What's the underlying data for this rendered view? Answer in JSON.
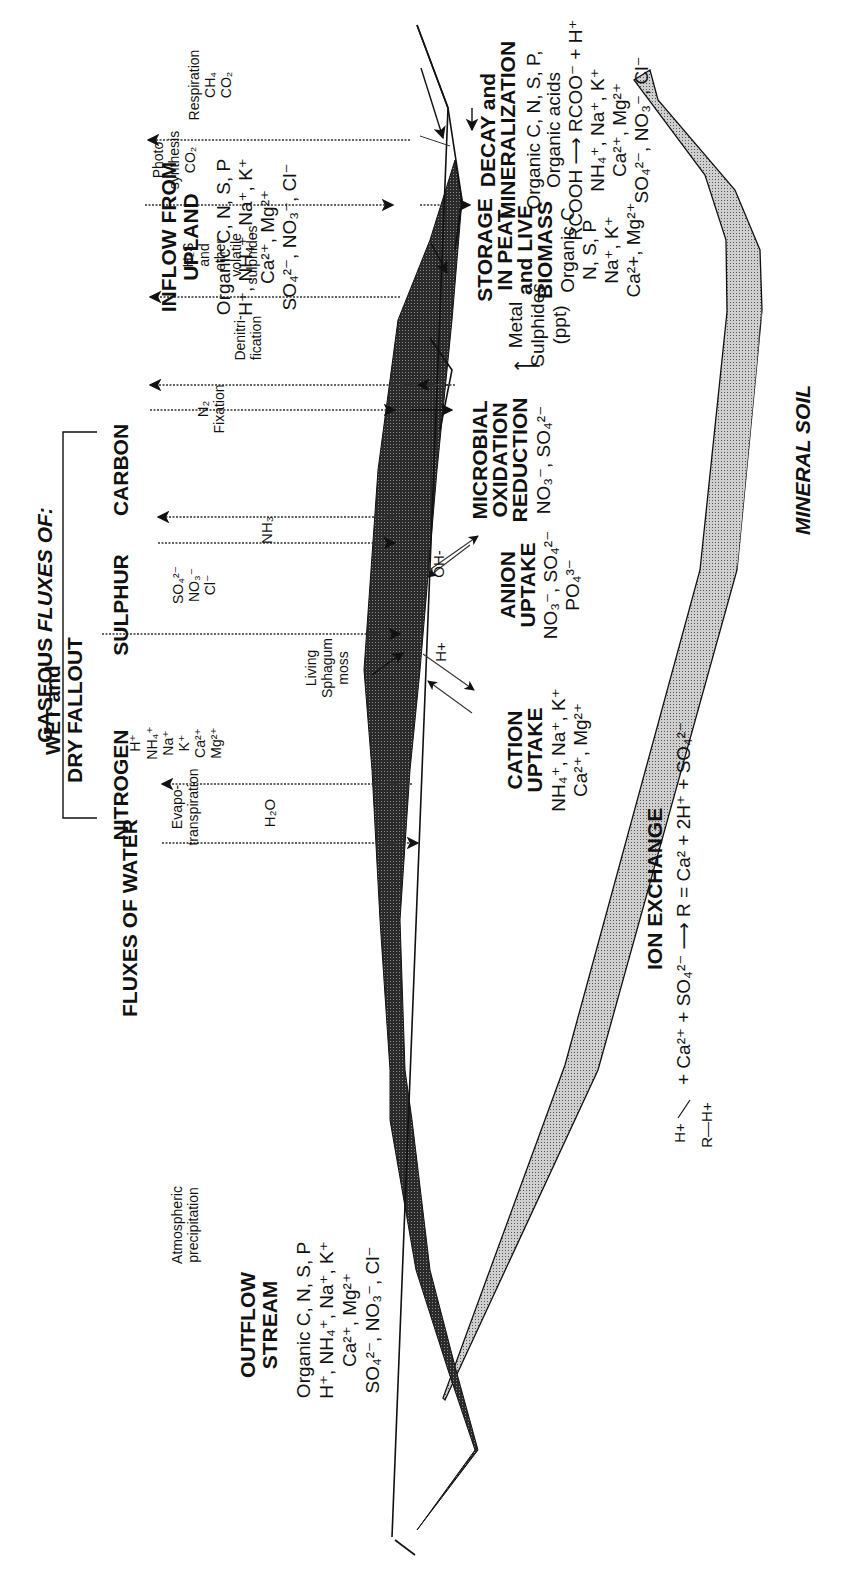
{
  "diagram": {
    "orientation": "rotated 90 degrees counter-clockwise",
    "sections": {
      "outflow": {
        "heading": [
          "OUTFLOW",
          "STREAM"
        ],
        "lines": [
          "Organic C, N, S, P",
          "H⁺, NH₄⁺, Na⁺, K⁺",
          "Ca²⁺, Mg²⁺",
          "SO₄²⁻, NO₃⁻, Cl⁻"
        ]
      },
      "water": {
        "heading": "FLUXES OF WATER",
        "left_label": [
          "Atmospheric",
          "precipitation"
        ],
        "right_label": [
          "Evapo-",
          "transpiration"
        ],
        "molecule": "H₂O",
        "moss_label": [
          "Living",
          "Sphagum",
          "moss"
        ]
      },
      "fallout": {
        "heading": [
          "WET and",
          "DRY FALLOUT"
        ],
        "cations": [
          "H⁺",
          "NH₄⁺",
          "Na⁺",
          "K⁺",
          "Ca²⁺",
          "Mg²⁺"
        ],
        "anions": [
          "SO₄²⁻",
          "NO₃⁻",
          "Cl⁻"
        ]
      },
      "gaseous": {
        "heading_prefix": "GASEOUS ",
        "heading_italic": "FLUXES OF:",
        "nitrogen": "NITROGEN",
        "sulphur": "SULPHUR",
        "carbon": "CARBON",
        "nh3": "NH₃",
        "n2": "N₂",
        "fixation": "Fixation",
        "denitrification": [
          "Denitri-",
          "fication"
        ],
        "h2s": [
          "H₂S",
          "and",
          "other",
          "volatile",
          "sulphides"
        ],
        "photosynthesis": [
          "Photo",
          "synthesis",
          "CO₂"
        ],
        "respiration": [
          "Respiration",
          "CH₄",
          "CO₂"
        ]
      },
      "inflow": {
        "heading": [
          "INFLOW FROM",
          "UPLAND"
        ],
        "lines": [
          "Organic C, N, S, P",
          "H⁺, NH₄⁺, Na⁺, K⁺",
          "Ca²⁺, Mg²⁺",
          "SO₄²⁻, NO₃⁻, Cl⁻"
        ]
      },
      "cation_uptake": {
        "heading": [
          "CATION",
          "UPTAKE"
        ],
        "lines": [
          "NH₄⁺, Na⁺, K⁺",
          "Ca²⁺, Mg²⁺"
        ],
        "exchange_ion": "H+"
      },
      "anion_uptake": {
        "heading": [
          "ANION",
          "UPTAKE"
        ],
        "lines": [
          "NO₃⁻, SO₄²⁻",
          "PO₄³⁻"
        ],
        "exchange_ion": "OH-"
      },
      "microbial": {
        "heading": [
          "MICROBIAL",
          "OXIDATION",
          "REDUCTION"
        ],
        "reactants": "NO₃⁻, SO₄²⁻",
        "arrow": "⟶",
        "products": [
          "Metal",
          "Sulphides",
          "(ppt)"
        ]
      },
      "storage": {
        "heading": [
          "STORAGE",
          "IN PEAT",
          "and LIVE",
          "BIOMASS"
        ],
        "lines": [
          "Organic C",
          "N, S, P",
          "Na⁺, K⁺",
          "Ca²+, Mg²⁺"
        ]
      },
      "decay": {
        "heading": [
          "DECAY and",
          "MINERALIZATION"
        ],
        "lines": [
          "Organic C, N, S, P,",
          "Organic acids",
          "RCOOH ⟶ RCOO⁻ + H⁺",
          "NH₄⁺, Na⁺, K⁺",
          "Ca²⁺, Mg²⁺",
          "SO₄²⁻, NO₃⁻, Cl⁻"
        ]
      },
      "ion_exchange": {
        "heading": "ION EXCHANGE",
        "equation": "+ Ca²⁺ + SO₄²⁻ ⟶ R = Ca² + 2H⁺ + SO₄²⁻",
        "resin_top": "H+",
        "resin_bottom": "R—H+"
      },
      "mineral_soil": {
        "label": "MINERAL SOIL"
      }
    },
    "colors": {
      "ink": "#111111",
      "peat_band": "#3a3a3a",
      "mineral_band": "#b5b5b5",
      "background": "#ffffff"
    }
  }
}
